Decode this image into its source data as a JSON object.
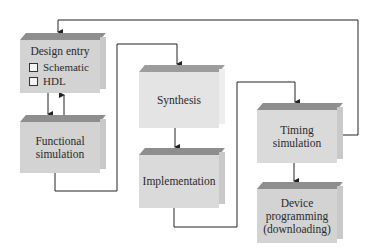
{
  "diagram": {
    "colors": {
      "box_top": "#8e8e8e",
      "box_front": "#d3d3d3",
      "wire": "#222222"
    },
    "nodes": [
      {
        "id": "design-entry",
        "label": "Design entry",
        "options": [
          "Schematic",
          "HDL"
        ]
      },
      {
        "id": "functional-simulation",
        "label_lines": [
          "Functional",
          "simulation"
        ]
      },
      {
        "id": "synthesis",
        "label": "Synthesis"
      },
      {
        "id": "implementation",
        "label": "Implementation"
      },
      {
        "id": "timing-simulation",
        "label_lines": [
          "Timing",
          "simulation"
        ]
      },
      {
        "id": "device-programming",
        "label_lines": [
          "Device",
          "programming",
          "(downloading)"
        ]
      }
    ],
    "edges": [
      {
        "from": "design-entry",
        "to": "functional-simulation"
      },
      {
        "from": "functional-simulation",
        "to": "design-entry"
      },
      {
        "from": "functional-simulation",
        "to": "synthesis"
      },
      {
        "from": "synthesis",
        "to": "implementation"
      },
      {
        "from": "implementation",
        "to": "timing-simulation"
      },
      {
        "from": "timing-simulation",
        "to": "device-programming"
      },
      {
        "from": "timing-simulation",
        "to": "design-entry"
      }
    ]
  }
}
